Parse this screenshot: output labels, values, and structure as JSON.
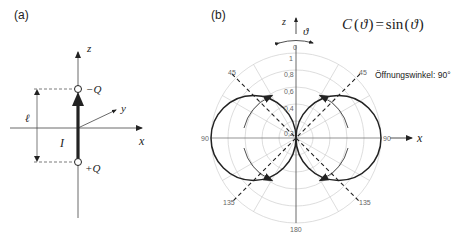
{
  "panel_a": {
    "label": "(a)",
    "axis_z": "z",
    "axis_x": "x",
    "axis_y": "y",
    "charge_top": "−Q",
    "charge_bottom": "+Q",
    "length_label": "ℓ",
    "current_label": "I"
  },
  "panel_b": {
    "label": "(b)",
    "axis_z": "z",
    "axis_x": "x",
    "angle_symbol": "ϑ",
    "formula": "C(ϑ) = sin(ϑ)",
    "formula_parts": {
      "c": "C",
      "open": "(",
      "theta": "ϑ",
      "close": ")",
      "eq": "=",
      "sin": "sin",
      "open2": "(",
      "theta2": "ϑ",
      "close2": ")"
    },
    "opening_angle": "Öffnungswinkel: 90°",
    "angle_ticks": {
      "t0": "0",
      "t45l": "45",
      "t45r": "45",
      "t90l": "90",
      "t90r": "90",
      "t135l": "135",
      "t135r": "135",
      "t180": "180"
    },
    "radial_ticks": {
      "r1": "1",
      "r08": "0,8",
      "r06": "0,6",
      "r04": "0,4",
      "r02": "0,2"
    }
  },
  "colors": {
    "line": "#222222",
    "grid": "#cccccc",
    "tick": "#666666"
  }
}
